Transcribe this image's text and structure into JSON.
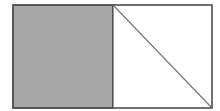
{
  "diagram": {
    "outer_rect": {
      "x": 13,
      "y": 5,
      "width": 199,
      "height": 103,
      "stroke": "#555555"
    },
    "left_square": {
      "x": 13,
      "y": 5,
      "width": 100,
      "height": 103,
      "fill": "#a8a8a8",
      "stroke": "#333333"
    },
    "right_square": {
      "x": 113,
      "y": 5,
      "width": 99,
      "height": 103,
      "fill": "#ffffff",
      "stroke": "#555555"
    },
    "diagonal": {
      "x1": 113,
      "y1": 5,
      "x2": 212,
      "y2": 108,
      "stroke": "#777777"
    }
  }
}
